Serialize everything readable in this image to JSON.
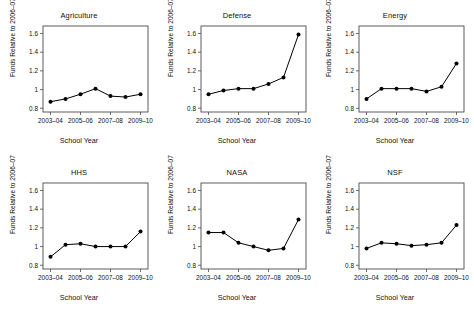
{
  "figure": {
    "panel_layout": "3 columns x 2 rows",
    "shared_xlabel": "School Year",
    "shared_ylabel": "Funds Relative to 2006–07"
  },
  "chart_data": [
    {
      "type": "line",
      "title": "Agriculture",
      "xlabel": "School Year",
      "ylabel": "Funds Relative to 2006–07",
      "categories": [
        "2003–04",
        "2004–05",
        "2005–06",
        "2006–07",
        "2007–08",
        "2008–09",
        "2009–10"
      ],
      "tick_labels": [
        "2003–04",
        "2005–06",
        "2007–08",
        "2009–10"
      ],
      "values": [
        0.87,
        0.9,
        0.95,
        1.01,
        0.93,
        0.92,
        0.95
      ],
      "ylim": [
        0.76,
        1.68
      ],
      "yticks": [
        0.8,
        1,
        1.2,
        1.4,
        1.6
      ],
      "ytick_labels": [
        "0.8",
        "1",
        "1.2",
        "1.4",
        "1.6"
      ],
      "grid": false,
      "legend": "none",
      "marker": "filled-circle",
      "line_color": "#000000"
    },
    {
      "type": "line",
      "title": "Defense",
      "xlabel": "School Year",
      "ylabel": "Funds Relative to 2006–07",
      "categories": [
        "2003–04",
        "2004–05",
        "2005–06",
        "2006–07",
        "2007–08",
        "2008–09",
        "2009–10"
      ],
      "tick_labels": [
        "2003–04",
        "2005–06",
        "2007–08",
        "2009–10"
      ],
      "values": [
        0.95,
        0.99,
        1.01,
        1.01,
        1.06,
        1.13,
        1.59
      ],
      "ylim": [
        0.76,
        1.68
      ],
      "yticks": [
        0.8,
        1,
        1.2,
        1.4,
        1.6
      ],
      "ytick_labels": [
        "0.8",
        "1",
        "1.2",
        "1.4",
        "1.6"
      ],
      "grid": false,
      "legend": "none",
      "marker": "filled-circle",
      "line_color": "#000000"
    },
    {
      "type": "line",
      "title": "Energy",
      "xlabel": "School Year",
      "ylabel": "Funds Relative to 2006–07",
      "categories": [
        "2003–04",
        "2004–05",
        "2005–06",
        "2006–07",
        "2007–08",
        "2008–09",
        "2009–10"
      ],
      "tick_labels": [
        "2003–04",
        "2005–06",
        "2007–08",
        "2009–10"
      ],
      "values": [
        0.9,
        1.01,
        1.01,
        1.01,
        0.98,
        1.03,
        1.28
      ],
      "ylim": [
        0.76,
        1.68
      ],
      "yticks": [
        0.8,
        1,
        1.2,
        1.4,
        1.6
      ],
      "ytick_labels": [
        "0.8",
        "1",
        "1.2",
        "1.4",
        "1.6"
      ],
      "grid": false,
      "legend": "none",
      "marker": "filled-circle",
      "line_color": "#000000"
    },
    {
      "type": "line",
      "title": "HHS",
      "xlabel": "School Year",
      "ylabel": "Funds Relative to 2006–07",
      "categories": [
        "2003–04",
        "2004–05",
        "2005–06",
        "2006–07",
        "2007–08",
        "2008–09",
        "2009–10"
      ],
      "tick_labels": [
        "2003–04",
        "2005–06",
        "2007–08",
        "2009–10"
      ],
      "values": [
        0.89,
        1.02,
        1.03,
        1.0,
        1.0,
        1.0,
        1.16
      ],
      "ylim": [
        0.76,
        1.68
      ],
      "yticks": [
        0.8,
        1,
        1.2,
        1.4,
        1.6
      ],
      "ytick_labels": [
        "0.8",
        "1",
        "1.2",
        "1.4",
        "1.6"
      ],
      "grid": false,
      "legend": "none",
      "marker": "filled-circle",
      "line_color": "#000000"
    },
    {
      "type": "line",
      "title": "NASA",
      "xlabel": "School Year",
      "ylabel": "Funds Relative to 2006–07",
      "categories": [
        "2003–04",
        "2004–05",
        "2005–06",
        "2006–07",
        "2007–08",
        "2008–09",
        "2009–10"
      ],
      "tick_labels": [
        "2003–04",
        "2005–06",
        "2007–08",
        "2009–10"
      ],
      "values": [
        1.15,
        1.15,
        1.04,
        1.0,
        0.96,
        0.98,
        1.29
      ],
      "ylim": [
        0.76,
        1.68
      ],
      "yticks": [
        0.8,
        1,
        1.2,
        1.4,
        1.6
      ],
      "ytick_labels": [
        "0.8",
        "1",
        "1.2",
        "1.4",
        "1.6"
      ],
      "grid": false,
      "legend": "none",
      "marker": "filled-circle",
      "line_color": "#000000"
    },
    {
      "type": "line",
      "title": "NSF",
      "xlabel": "School Year",
      "ylabel": "Funds Relative to 2006–07",
      "categories": [
        "2003–04",
        "2004–05",
        "2005–06",
        "2006–07",
        "2007–08",
        "2008–09",
        "2009–10"
      ],
      "tick_labels": [
        "2003–04",
        "2005–06",
        "2007–08",
        "2009–10"
      ],
      "values": [
        0.98,
        1.04,
        1.03,
        1.01,
        1.02,
        1.04,
        1.23
      ],
      "ylim": [
        0.76,
        1.68
      ],
      "yticks": [
        0.8,
        1,
        1.2,
        1.4,
        1.6
      ],
      "ytick_labels": [
        "0.8",
        "1",
        "1.2",
        "1.4",
        "1.6"
      ],
      "grid": false,
      "legend": "none",
      "marker": "filled-circle",
      "line_color": "#000000"
    }
  ]
}
